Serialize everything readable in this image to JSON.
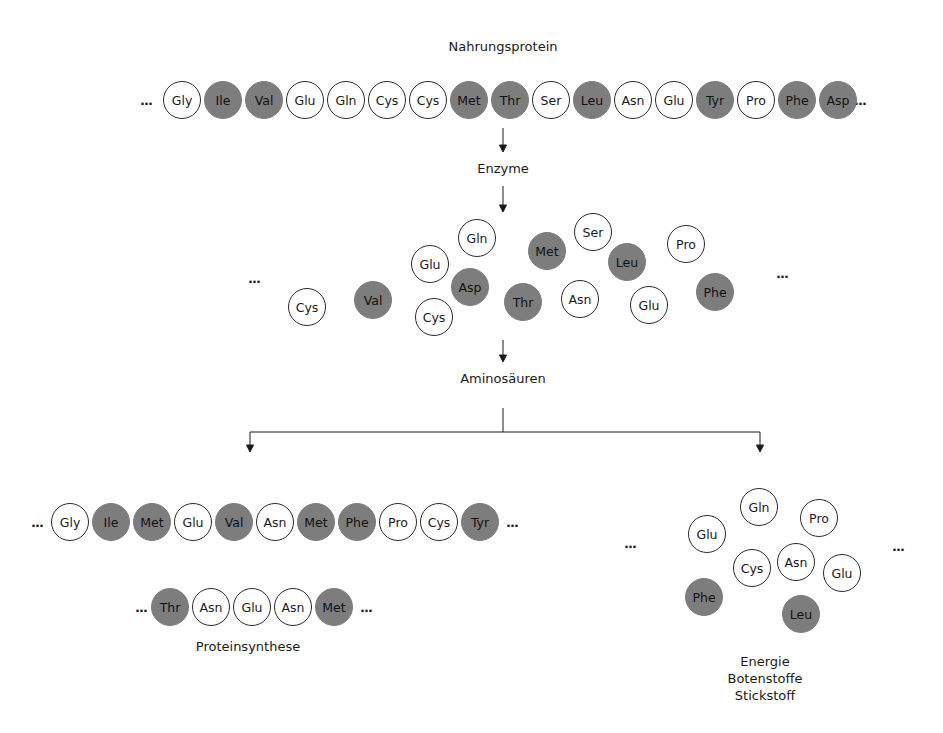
{
  "labels": {
    "title": "Nahrungsprotein",
    "step1": "Enzyme",
    "step2": "Aminosäuren",
    "left_output": "Proteinsynthese",
    "right_output_1": "Energie",
    "right_output_2": "Botenstoffe",
    "right_output_3": "Stickstoff",
    "ellipsis": "..."
  },
  "colors": {
    "filled": "#7d7d7d",
    "open_border": "#2a2a2a"
  },
  "dietary_protein_chain": [
    {
      "name": "Gly",
      "filled": false
    },
    {
      "name": "Ile",
      "filled": true
    },
    {
      "name": "Val",
      "filled": true
    },
    {
      "name": "Glu",
      "filled": false
    },
    {
      "name": "Gln",
      "filled": false
    },
    {
      "name": "Cys",
      "filled": false
    },
    {
      "name": "Cys",
      "filled": false
    },
    {
      "name": "Met",
      "filled": true
    },
    {
      "name": "Thr",
      "filled": true
    },
    {
      "name": "Ser",
      "filled": false
    },
    {
      "name": "Leu",
      "filled": true
    },
    {
      "name": "Asn",
      "filled": false
    },
    {
      "name": "Glu",
      "filled": false
    },
    {
      "name": "Tyr",
      "filled": true
    },
    {
      "name": "Pro",
      "filled": false
    },
    {
      "name": "Phe",
      "filled": true
    },
    {
      "name": "Asp",
      "filled": true
    }
  ],
  "free_amino_acids": [
    {
      "name": "Cys",
      "filled": false,
      "x": 307,
      "y": 307
    },
    {
      "name": "Val",
      "filled": true,
      "x": 373,
      "y": 300
    },
    {
      "name": "Glu",
      "filled": false,
      "x": 430,
      "y": 264
    },
    {
      "name": "Gln",
      "filled": false,
      "x": 477,
      "y": 238
    },
    {
      "name": "Asp",
      "filled": true,
      "x": 470,
      "y": 287
    },
    {
      "name": "Cys",
      "filled": false,
      "x": 434,
      "y": 317
    },
    {
      "name": "Thr",
      "filled": true,
      "x": 523,
      "y": 302
    },
    {
      "name": "Met",
      "filled": true,
      "x": 547,
      "y": 251
    },
    {
      "name": "Ser",
      "filled": false,
      "x": 593,
      "y": 232
    },
    {
      "name": "Asn",
      "filled": false,
      "x": 580,
      "y": 299
    },
    {
      "name": "Leu",
      "filled": true,
      "x": 627,
      "y": 262
    },
    {
      "name": "Glu",
      "filled": false,
      "x": 649,
      "y": 305
    },
    {
      "name": "Pro",
      "filled": false,
      "x": 686,
      "y": 244
    },
    {
      "name": "Phe",
      "filled": true,
      "x": 715,
      "y": 292
    }
  ],
  "synthesis_chain_1": [
    {
      "name": "Gly",
      "filled": false
    },
    {
      "name": "Ile",
      "filled": true
    },
    {
      "name": "Met",
      "filled": true
    },
    {
      "name": "Glu",
      "filled": false
    },
    {
      "name": "Val",
      "filled": true
    },
    {
      "name": "Asn",
      "filled": false
    },
    {
      "name": "Met",
      "filled": true
    },
    {
      "name": "Phe",
      "filled": true
    },
    {
      "name": "Pro",
      "filled": false
    },
    {
      "name": "Cys",
      "filled": false
    },
    {
      "name": "Tyr",
      "filled": true
    }
  ],
  "synthesis_chain_2": [
    {
      "name": "Thr",
      "filled": true
    },
    {
      "name": "Asn",
      "filled": false
    },
    {
      "name": "Glu",
      "filled": false
    },
    {
      "name": "Asn",
      "filled": false
    },
    {
      "name": "Met",
      "filled": true
    }
  ],
  "catabolism_pool": [
    {
      "name": "Gln",
      "filled": false,
      "x": 759,
      "y": 507
    },
    {
      "name": "Glu",
      "filled": false,
      "x": 707,
      "y": 534
    },
    {
      "name": "Pro",
      "filled": false,
      "x": 819,
      "y": 518
    },
    {
      "name": "Cys",
      "filled": false,
      "x": 752,
      "y": 568
    },
    {
      "name": "Asn",
      "filled": false,
      "x": 796,
      "y": 562
    },
    {
      "name": "Glu",
      "filled": false,
      "x": 842,
      "y": 573
    },
    {
      "name": "Phe",
      "filled": true,
      "x": 704,
      "y": 597
    },
    {
      "name": "Leu",
      "filled": true,
      "x": 801,
      "y": 614
    }
  ]
}
